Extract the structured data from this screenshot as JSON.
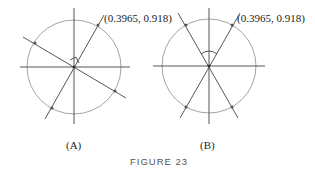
{
  "figure": {
    "caption": "FIGURE 23",
    "panels": [
      {
        "label": "(A)",
        "point_label": "(0.3965, 0.918)",
        "description": "Unit circle with line through (0.3965, 0.918) and perpendicular line through origin"
      },
      {
        "label": "(B)",
        "point_label": "(0.3965, 0.918)",
        "description": "Unit circle with line through (0.3965, 0.918) and its reflection across the y-axis"
      }
    ]
  },
  "colors": {
    "circle": "#999999",
    "lines": "#444444",
    "points": "#555555"
  }
}
